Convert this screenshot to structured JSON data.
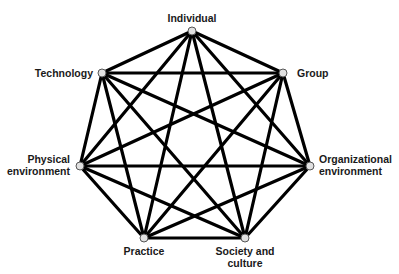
{
  "diagram": {
    "type": "complete-graph",
    "nodes": [
      {
        "id": "individual",
        "label": "Individual",
        "x": 192,
        "y": 31
      },
      {
        "id": "group",
        "label": "Group",
        "x": 283,
        "y": 73
      },
      {
        "id": "organizational",
        "label_line1": "Organizational",
        "label_line2": "environment",
        "x": 310,
        "y": 166
      },
      {
        "id": "society",
        "label_line1": "Society and",
        "label_line2": "culture",
        "x": 245,
        "y": 238
      },
      {
        "id": "practice",
        "label": "Practice",
        "x": 144,
        "y": 238
      },
      {
        "id": "physical",
        "label_line1": "Physical",
        "label_line2": "environment",
        "x": 80,
        "y": 166
      },
      {
        "id": "technology",
        "label": "Technology",
        "x": 102,
        "y": 73
      }
    ],
    "edge_color": "#000000",
    "node_fill": "#e0e0e0"
  }
}
